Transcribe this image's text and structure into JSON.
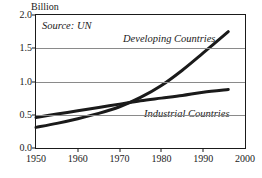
{
  "chart_data": {
    "type": "line",
    "title": "",
    "subtitle": "",
    "unit_label": "Billion",
    "source_note": "Source: UN",
    "xlabel": "",
    "ylabel": "Billion",
    "xlim": [
      1950,
      2000
    ],
    "ylim": [
      0.0,
      2.0
    ],
    "xticks": [
      1950,
      1960,
      1970,
      1980,
      1990,
      2000
    ],
    "xtick_labels": [
      "1950",
      "1960",
      "1970",
      "1980",
      "1990",
      "2000"
    ],
    "yticks": [
      0.0,
      0.5,
      1.0,
      1.5,
      2.0
    ],
    "ytick_labels": [
      "0.0",
      "0.5",
      "1.0",
      "1.5",
      "2.0"
    ],
    "grid": "horizontal",
    "legend": "inline-annotations",
    "line_color": "#1a1a1a",
    "grid_color": "#8a8a8a",
    "series": [
      {
        "name": "Developing Countries",
        "label_position": "upper-middle",
        "x": [
          1950,
          1955,
          1960,
          1965,
          1970,
          1975,
          1980,
          1985,
          1990,
          1996
        ],
        "values": [
          0.31,
          0.37,
          0.44,
          0.52,
          0.62,
          0.76,
          0.94,
          1.17,
          1.43,
          1.75
        ]
      },
      {
        "name": "Industrial Countries",
        "label_position": "lower-middle",
        "x": [
          1950,
          1955,
          1960,
          1965,
          1970,
          1975,
          1980,
          1985,
          1990,
          1996
        ],
        "values": [
          0.46,
          0.51,
          0.56,
          0.61,
          0.66,
          0.71,
          0.75,
          0.79,
          0.84,
          0.88
        ]
      }
    ]
  }
}
